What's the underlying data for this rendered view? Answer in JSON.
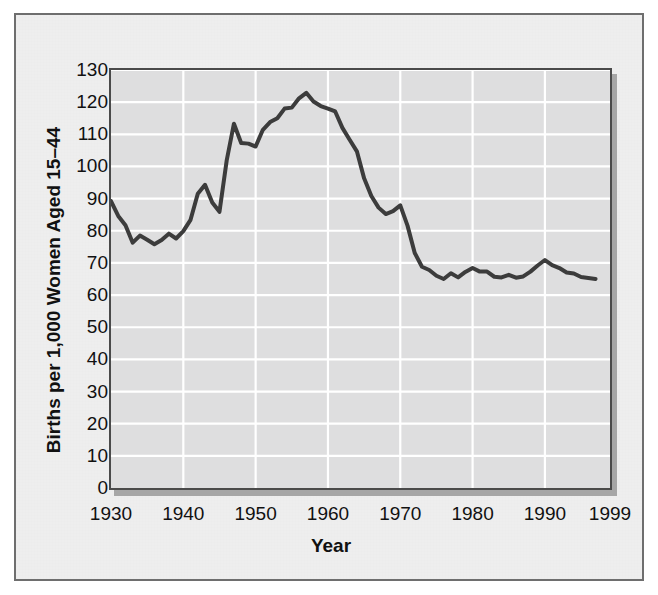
{
  "chart_data": {
    "type": "line",
    "title": "",
    "subtitle": "",
    "xlabel": "Year",
    "ylabel": "Births per 1,000 Women Aged 15–44",
    "xlim": [
      1930,
      1999
    ],
    "ylim": [
      0,
      130
    ],
    "y_ticks": [
      0,
      10,
      20,
      30,
      40,
      50,
      60,
      70,
      80,
      90,
      100,
      110,
      120,
      130
    ],
    "x_ticks": [
      1930,
      1940,
      1950,
      1960,
      1970,
      1980,
      1990,
      1999
    ],
    "x_tick_labels": [
      "1930",
      "1940",
      "1950",
      "1960",
      "1970",
      "1980",
      "1990",
      "1999"
    ],
    "y_tick_labels": [
      "130",
      "120",
      "110",
      "100",
      "90",
      "80",
      "70",
      "60",
      "50",
      "40",
      "30",
      "20",
      "10",
      "0"
    ],
    "grid": "both",
    "grid_color": "#ffffff",
    "legend": "none",
    "series": [
      {
        "name": "Fertility rate",
        "color": "#3c3c3c",
        "line_width": 4,
        "x": [
          1930,
          1931,
          1932,
          1933,
          1934,
          1935,
          1936,
          1937,
          1938,
          1939,
          1940,
          1941,
          1942,
          1943,
          1944,
          1945,
          1946,
          1947,
          1948,
          1949,
          1950,
          1951,
          1952,
          1953,
          1954,
          1955,
          1956,
          1957,
          1958,
          1959,
          1960,
          1961,
          1962,
          1963,
          1964,
          1965,
          1966,
          1967,
          1968,
          1969,
          1970,
          1971,
          1972,
          1973,
          1974,
          1975,
          1976,
          1977,
          1978,
          1979,
          1980,
          1981,
          1982,
          1983,
          1984,
          1985,
          1986,
          1987,
          1988,
          1989,
          1990,
          1991,
          1992,
          1993,
          1994,
          1995,
          1996,
          1997
        ],
        "values": [
          89.2,
          84.6,
          81.7,
          76.3,
          78.5,
          77.2,
          75.8,
          77.1,
          79.1,
          77.6,
          79.9,
          83.4,
          91.5,
          94.3,
          88.8,
          85.9,
          101.9,
          113.3,
          107.3,
          107.1,
          106.2,
          111.4,
          113.8,
          115.0,
          118.0,
          118.3,
          121.2,
          122.9,
          120.2,
          118.8,
          118.0,
          117.1,
          112.0,
          108.3,
          104.7,
          96.3,
          90.8,
          87.2,
          85.2,
          86.1,
          87.9,
          81.6,
          73.1,
          68.8,
          67.8,
          66.0,
          65.0,
          66.8,
          65.5,
          67.2,
          68.4,
          67.3,
          67.3,
          65.7,
          65.5,
          66.3,
          65.4,
          65.8,
          67.3,
          69.2,
          70.9,
          69.3,
          68.4,
          67.0,
          66.7,
          65.6,
          65.3,
          65.0
        ]
      }
    ]
  },
  "figure": {
    "background_color": "#eeeeee",
    "frame_color": "#6e6e6e",
    "plot_background_color": "#dededf",
    "plot_border_color": "#4a4a4a",
    "shadow_color": "#a6a6a6"
  }
}
